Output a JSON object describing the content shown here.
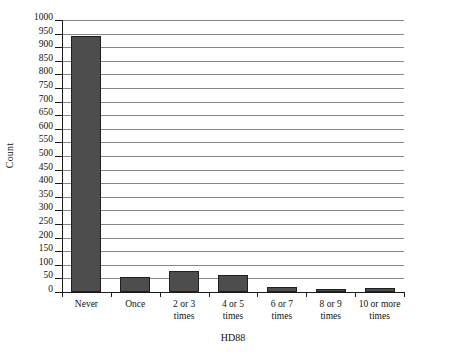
{
  "chart_data": {
    "type": "bar",
    "title": "",
    "xlabel": "HD88",
    "ylabel": "Count",
    "categories": [
      "Never",
      "Once",
      "2 or 3\ntimes",
      "4 or 5\ntimes",
      "6 or 7\ntimes",
      "8 or 9\ntimes",
      "10 or more\ntimes"
    ],
    "values": [
      940,
      57,
      78,
      62,
      17,
      11,
      14
    ],
    "ylim": [
      0,
      1000
    ],
    "ytick_step": 50,
    "yticks": [
      "0",
      "50",
      "100",
      "150",
      "200",
      "250",
      "300",
      "350",
      "400",
      "450",
      "500",
      "550",
      "600",
      "650",
      "700",
      "750",
      "800",
      "850",
      "900",
      "950",
      "1000"
    ],
    "grid": true,
    "legend": "none",
    "bar_color": "#4d4d4d",
    "bar_edge_color": "#1f1f1f",
    "gridline_color": "#878787",
    "axis_color": "#1a1a1a"
  }
}
